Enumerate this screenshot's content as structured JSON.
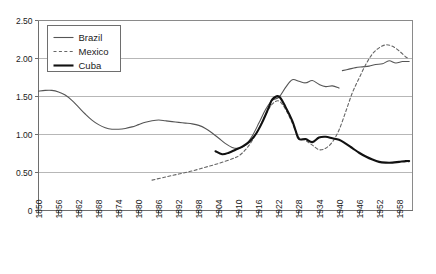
{
  "chart_data": {
    "type": "line",
    "title": "",
    "xlabel": "",
    "ylabel": "",
    "xlim": [
      1850,
      1962
    ],
    "ylim": [
      0,
      2.5
    ],
    "grid": true,
    "legend_position": "top-left",
    "y_ticks": [
      "0",
      "0.50",
      "1.00",
      "1.50",
      "2.00",
      "2.50"
    ],
    "y_tick_values": [
      0,
      0.5,
      1.0,
      1.5,
      2.0,
      2.5
    ],
    "x_ticks": [
      "1850",
      "1856",
      "1862",
      "1868",
      "1874",
      "1880",
      "1886",
      "1892",
      "1898",
      "1904",
      "1910",
      "1916",
      "1922",
      "1928",
      "1934",
      "1940",
      "1946",
      "1952",
      "1958"
    ],
    "x_tick_values": [
      1850,
      1856,
      1862,
      1868,
      1874,
      1880,
      1886,
      1892,
      1898,
      1904,
      1910,
      1916,
      1922,
      1928,
      1934,
      1940,
      1946,
      1952,
      1958
    ],
    "series": [
      {
        "name": "Brazil",
        "style": "solid-thin",
        "color": "#555555",
        "width": 1.1,
        "segments": [
          {
            "x": [
              1850,
              1852,
              1854,
              1856,
              1858,
              1860,
              1862,
              1864,
              1866,
              1868,
              1870,
              1872,
              1874,
              1876,
              1878,
              1880,
              1882,
              1884,
              1886,
              1888,
              1890,
              1892,
              1894,
              1896,
              1898,
              1900,
              1902,
              1904,
              1906,
              1908,
              1910,
              1912,
              1914,
              1916,
              1918,
              1920,
              1922,
              1924,
              1926,
              1928,
              1930,
              1932,
              1934,
              1936,
              1938,
              1940
            ],
            "y": [
              1.57,
              1.58,
              1.58,
              1.56,
              1.52,
              1.45,
              1.36,
              1.27,
              1.19,
              1.13,
              1.09,
              1.07,
              1.07,
              1.08,
              1.1,
              1.13,
              1.16,
              1.18,
              1.19,
              1.18,
              1.17,
              1.16,
              1.15,
              1.14,
              1.12,
              1.08,
              1.02,
              0.95,
              0.88,
              0.83,
              0.82,
              0.86,
              0.98,
              1.15,
              1.33,
              1.45,
              1.49,
              1.62,
              1.72,
              1.7,
              1.68,
              1.71,
              1.66,
              1.63,
              1.64,
              1.61
            ]
          },
          {
            "x": [
              1941,
              1943,
              1945,
              1947,
              1949,
              1951,
              1953,
              1955,
              1957,
              1959,
              1961
            ],
            "y": [
              1.84,
              1.86,
              1.88,
              1.89,
              1.9,
              1.92,
              1.93,
              1.97,
              1.94,
              1.96,
              1.96
            ]
          }
        ]
      },
      {
        "name": "Mexico",
        "style": "dashed",
        "color": "#666666",
        "width": 1.1,
        "segments": [
          {
            "x": [
              1884,
              1888,
              1892,
              1896,
              1900,
              1904,
              1908,
              1910,
              1912,
              1914,
              1916,
              1918,
              1920,
              1922,
              1924,
              1926,
              1928,
              1930,
              1932,
              1934,
              1936,
              1938,
              1940,
              1942,
              1944,
              1946,
              1948,
              1950,
              1952,
              1954,
              1956,
              1958,
              1960,
              1961
            ],
            "y": [
              0.4,
              0.44,
              0.48,
              0.52,
              0.57,
              0.62,
              0.68,
              0.72,
              0.8,
              0.92,
              1.08,
              1.26,
              1.4,
              1.44,
              1.33,
              1.15,
              0.96,
              0.92,
              0.86,
              0.8,
              0.82,
              0.9,
              1.06,
              1.3,
              1.55,
              1.74,
              1.92,
              2.06,
              2.14,
              2.18,
              2.16,
              2.1,
              2.02,
              2.0
            ]
          }
        ]
      },
      {
        "name": "Cuba",
        "style": "solid-thick",
        "color": "#111111",
        "width": 2.1,
        "segments": [
          {
            "x": [
              1903,
              1905,
              1907,
              1909,
              1911,
              1913,
              1915,
              1917,
              1919,
              1920,
              1922,
              1924,
              1926,
              1927,
              1928,
              1930,
              1932,
              1934,
              1936,
              1938,
              1940,
              1942,
              1944,
              1946,
              1948,
              1950,
              1952,
              1954,
              1956,
              1958,
              1960,
              1961
            ],
            "y": [
              0.78,
              0.74,
              0.76,
              0.8,
              0.84,
              0.9,
              1.0,
              1.16,
              1.36,
              1.46,
              1.5,
              1.36,
              1.18,
              1.05,
              0.94,
              0.94,
              0.9,
              0.96,
              0.97,
              0.95,
              0.93,
              0.88,
              0.82,
              0.76,
              0.71,
              0.67,
              0.64,
              0.63,
              0.63,
              0.64,
              0.65,
              0.65
            ]
          }
        ]
      }
    ],
    "legend": [
      {
        "label": "Brazil",
        "style": "solid-thin"
      },
      {
        "label": "Mexico",
        "style": "dashed"
      },
      {
        "label": "Cuba",
        "style": "solid-thick"
      }
    ]
  }
}
